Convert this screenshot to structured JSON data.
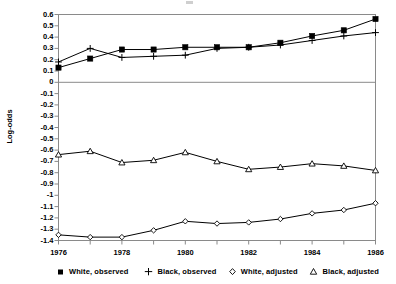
{
  "chart_data": {
    "type": "line",
    "title": "",
    "subtitle": "",
    "xlabel": "",
    "ylabel": "Log-odds",
    "x": [
      1976,
      1977,
      1978,
      1979,
      1980,
      1981,
      1982,
      1983,
      1984,
      1985,
      1986
    ],
    "xlim": [
      1976,
      1986
    ],
    "ylim": [
      -1.4,
      0.6
    ],
    "xtick_labels": [
      "1976",
      "1978",
      "1980",
      "1982",
      "1984",
      "1986"
    ],
    "xtick_values": [
      1976,
      1978,
      1980,
      1982,
      1984,
      1986
    ],
    "ytick_labels": [
      "0.6",
      "0.5",
      "0.4",
      "0.3",
      "0.2",
      "0.1",
      "0",
      "-0.1",
      "-0.2",
      "-0.3",
      "-0.4",
      "-0.5",
      "-0.6",
      "-0.7",
      "-0.8",
      "-0.9",
      "-1",
      "-1.1",
      "-1.2",
      "-1.3",
      "-1.4"
    ],
    "ytick_values": [
      0.6,
      0.5,
      0.4,
      0.3,
      0.2,
      0.1,
      0,
      -0.1,
      -0.2,
      -0.3,
      -0.4,
      -0.5,
      -0.6,
      -0.7,
      -0.8,
      -0.9,
      -1.0,
      -1.1,
      -1.2,
      -1.3,
      -1.4
    ],
    "grid": false,
    "zero_line": 0,
    "legend_position": "bottom",
    "series": [
      {
        "name": "White, observed",
        "marker": "filled-square",
        "color": "#000000",
        "values": [
          0.13,
          0.21,
          0.29,
          0.29,
          0.31,
          0.31,
          0.31,
          0.35,
          0.41,
          0.46,
          0.56
        ]
      },
      {
        "name": "Black, observed",
        "marker": "plus",
        "color": "#000000",
        "values": [
          0.18,
          0.3,
          0.22,
          0.23,
          0.24,
          0.3,
          0.31,
          0.33,
          0.37,
          0.41,
          0.44
        ]
      },
      {
        "name": "White, adjusted",
        "marker": "open-diamond",
        "color": "#000000",
        "values": [
          -1.35,
          -1.37,
          -1.37,
          -1.31,
          -1.23,
          -1.25,
          -1.24,
          -1.21,
          -1.16,
          -1.13,
          -1.07
        ]
      },
      {
        "name": "Black, adjusted",
        "marker": "open-triangle",
        "color": "#000000",
        "values": [
          -0.64,
          -0.61,
          -0.71,
          -0.69,
          -0.62,
          -0.7,
          -0.77,
          -0.75,
          -0.72,
          -0.74,
          -0.78
        ]
      }
    ]
  },
  "axis": {
    "y_title": "Log-odds"
  },
  "legend": {
    "items": [
      {
        "label": "White, observed",
        "marker": "filled-square-icon"
      },
      {
        "label": "Black, observed",
        "marker": "plus-icon"
      },
      {
        "label": "White, adjusted",
        "marker": "open-diamond-icon"
      },
      {
        "label": "Black, adjusted",
        "marker": "open-triangle-icon"
      }
    ]
  },
  "colors": {
    "axis": "#8a8a8a",
    "series": "#000000",
    "background": "#ffffff",
    "zero_line": "#8a8a8a"
  }
}
